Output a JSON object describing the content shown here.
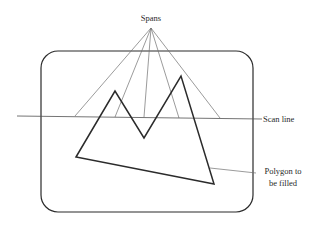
{
  "diagram": {
    "labels": {
      "spans": "Spans",
      "scan_line": "Scan line",
      "polygon_line1": "Polygon to",
      "polygon_line2": "be filled"
    },
    "colors": {
      "background": "#ffffff",
      "frame": "#2b2b2b",
      "polygon": "#2b2b2b",
      "spans": "#707070",
      "scan_line": "#505050",
      "text": "#2a2a2a"
    },
    "frame": {
      "x": 41,
      "y": 51,
      "width": 212,
      "height": 161,
      "radius": 17
    },
    "polygon": {
      "vertices": [
        [
          76,
          157
        ],
        [
          115,
          91
        ],
        [
          144,
          138
        ],
        [
          181,
          76
        ],
        [
          214,
          184
        ]
      ]
    },
    "scan_line": {
      "x1": 17,
      "y1": 116,
      "x2": 262,
      "y2": 119
    },
    "spans": {
      "origin": [
        151,
        28
      ],
      "endpoints": [
        [
          75,
          116
        ],
        [
          115,
          117
        ],
        [
          144,
          117
        ],
        [
          179,
          118
        ],
        [
          220,
          118
        ]
      ]
    },
    "polygon_leader": {
      "x1": 210,
      "y1": 168,
      "x2": 256,
      "y2": 173
    }
  }
}
